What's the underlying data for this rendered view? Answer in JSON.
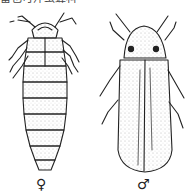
{
  "caption": {
    "text": "雷也可萍虫蜂科"
  },
  "figure": {
    "specimens": [
      {
        "id": "female",
        "symbol": "♀",
        "position": "left"
      },
      {
        "id": "male",
        "symbol": "♂",
        "position": "right"
      }
    ],
    "colors": {
      "ink": "#222222",
      "background": "#ffffff",
      "stipple": "#777777"
    }
  }
}
